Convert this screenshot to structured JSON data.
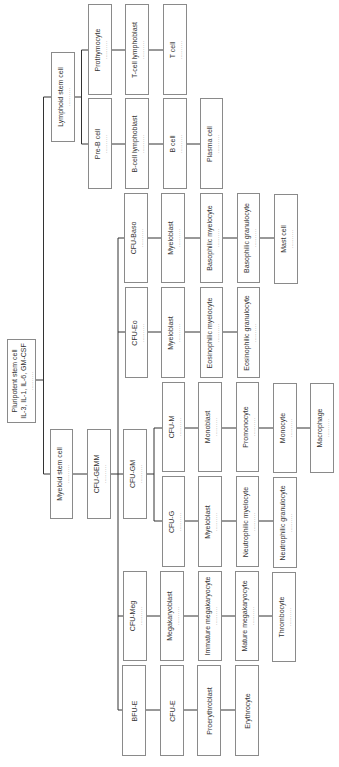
{
  "diagram": {
    "line_color": "#333333",
    "box_border_color": "#8a8a8a",
    "dots": "..........",
    "nodes": {
      "pluripotent": {
        "label": "Pluripotent stem cell",
        "sub": "IL-3, IL-1, IL-6, GM-CSF",
        "dotted": true
      },
      "lymphoid": {
        "label": "Lymphoid stem cell",
        "dotted": true
      },
      "prothymocyte": {
        "label": "Prothymocyte",
        "dotted": true
      },
      "t_lymphoblast": {
        "label": "T-cell lymphoblast",
        "dotted": true
      },
      "t_cell": {
        "label": "T cell",
        "dotted": true
      },
      "pre_b": {
        "label": "Pre-B cell",
        "dotted": true
      },
      "b_lymphoblast": {
        "label": "B-cell lymphoblast",
        "dotted": true
      },
      "b_cell": {
        "label": "B cell",
        "dotted": true
      },
      "plasma": {
        "label": "Plasma cell",
        "dotted": true
      },
      "myeloid": {
        "label": "Myeloid stem cell",
        "dotted": true
      },
      "cfu_gemm": {
        "label": "CFU-GEMM",
        "dotted": true
      },
      "cfu_baso": {
        "label": "CFU-Baso",
        "dotted": true
      },
      "baso_myeloblast": {
        "label": "Myeloblast",
        "dotted": true
      },
      "baso_myelocyte": {
        "label": "Basophilic myelocyte",
        "dotted": true
      },
      "baso_granulocyte": {
        "label": "Basophilic granulocyte",
        "dotted": true
      },
      "mast": {
        "label": "Mast cell",
        "dotted": true
      },
      "cfu_eo": {
        "label": "CFU-Eo",
        "dotted": true
      },
      "eo_myeloblast": {
        "label": "Myeloblast",
        "dotted": true
      },
      "eo_myelocyte": {
        "label": "Eosinophilic myelocyte",
        "dotted": true
      },
      "eo_granulocyte": {
        "label": "Eosinophilic granulocyte",
        "dotted": true
      },
      "cfu_gm": {
        "label": "CFU-GM",
        "dotted": true
      },
      "cfu_m": {
        "label": "CFU-M",
        "dotted": true
      },
      "monoblast": {
        "label": "Monoblast",
        "dotted": true
      },
      "promonocyte": {
        "label": "Promonocyte",
        "dotted": true
      },
      "monocyte": {
        "label": "Monocyte",
        "dotted": true
      },
      "macrophage": {
        "label": "Macrophage",
        "dotted": true
      },
      "cfu_g": {
        "label": "CFU-G",
        "dotted": true
      },
      "neut_myeloblast": {
        "label": "Myeloblast",
        "dotted": true
      },
      "neut_myelocyte": {
        "label": "Neutrophilic myelocyte",
        "dotted": true
      },
      "neut_granulocyte": {
        "label": "Neutrophilic granulocyte",
        "dotted": true
      },
      "cfu_meg": {
        "label": "CFU-Meg",
        "dotted": true
      },
      "megakaryoblast": {
        "label": "Megakaryoblast",
        "dotted": true
      },
      "immature_mega": {
        "label": "Immature megakaryocyte",
        "dotted": true
      },
      "mature_mega": {
        "label": "Mature megakaryocyte",
        "dotted": true
      },
      "thrombocyte": {
        "label": "Thrombocyte",
        "dotted": true
      },
      "bfu_e": {
        "label": "BFU-E",
        "dotted": false
      },
      "cfu_e": {
        "label": "CFU-E",
        "dotted": false
      },
      "proerythroblast": {
        "label": "Proerythroblast",
        "dotted": false
      },
      "erythrocyte": {
        "label": "Erythrocyte",
        "dotted": false
      }
    },
    "edges": [
      [
        "pluripotent",
        "lymphoid"
      ],
      [
        "pluripotent",
        "myeloid"
      ],
      [
        "lymphoid",
        "prothymocyte"
      ],
      [
        "prothymocyte",
        "t_lymphoblast"
      ],
      [
        "t_lymphoblast",
        "t_cell"
      ],
      [
        "lymphoid",
        "pre_b"
      ],
      [
        "pre_b",
        "b_lymphoblast"
      ],
      [
        "b_lymphoblast",
        "b_cell"
      ],
      [
        "b_cell",
        "plasma"
      ],
      [
        "myeloid",
        "cfu_gemm"
      ],
      [
        "cfu_gemm",
        "cfu_baso"
      ],
      [
        "cfu_baso",
        "baso_myeloblast"
      ],
      [
        "baso_myeloblast",
        "baso_myelocyte"
      ],
      [
        "baso_myelocyte",
        "baso_granulocyte"
      ],
      [
        "baso_granulocyte",
        "mast"
      ],
      [
        "cfu_gemm",
        "cfu_eo"
      ],
      [
        "cfu_eo",
        "eo_myeloblast"
      ],
      [
        "eo_myeloblast",
        "eo_myelocyte"
      ],
      [
        "eo_myelocyte",
        "eo_granulocyte"
      ],
      [
        "cfu_gemm",
        "cfu_gm"
      ],
      [
        "cfu_gm",
        "cfu_m"
      ],
      [
        "cfu_m",
        "monoblast"
      ],
      [
        "monoblast",
        "promonocyte"
      ],
      [
        "promonocyte",
        "monocyte"
      ],
      [
        "monocyte",
        "macrophage"
      ],
      [
        "cfu_gm",
        "cfu_g"
      ],
      [
        "cfu_g",
        "neut_myeloblast"
      ],
      [
        "neut_myeloblast",
        "neut_myelocyte"
      ],
      [
        "neut_myelocyte",
        "neut_granulocyte"
      ],
      [
        "cfu_gemm",
        "cfu_meg"
      ],
      [
        "cfu_meg",
        "megakaryoblast"
      ],
      [
        "megakaryoblast",
        "immature_mega"
      ],
      [
        "immature_mega",
        "mature_mega"
      ],
      [
        "mature_mega",
        "thrombocyte"
      ],
      [
        "cfu_gemm",
        "bfu_e"
      ],
      [
        "bfu_e",
        "cfu_e"
      ],
      [
        "cfu_e",
        "proerythroblast"
      ],
      [
        "proerythroblast",
        "erythrocyte"
      ]
    ]
  }
}
